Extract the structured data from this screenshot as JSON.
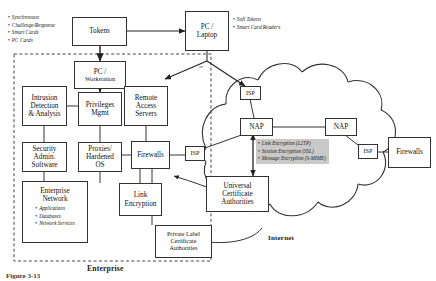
{
  "figure": {
    "caption_bottom": "Enterprise",
    "internet_label": "Internet",
    "or_label": "or",
    "figure_number": "Figure 3-13"
  },
  "annotations": {
    "token_types": [
      "Synchronous",
      "Challenge/Response",
      "Smart Cards",
      "PC Cards"
    ],
    "laptop_types": [
      "Soft Tokens",
      "Smart Card Readers"
    ],
    "encryption_layers": [
      "Link Encryption  (L2TP)",
      "Session Encryption (SSL)",
      "Message Encryption (S-MIME)"
    ]
  },
  "nodes": {
    "tokens": {
      "lines": [
        "Tokens"
      ]
    },
    "pc_laptop": {
      "lines": [
        "PC /",
        "Laptop"
      ]
    },
    "pc_workstation": {
      "lines": [
        "PC /",
        "Workstation"
      ]
    },
    "intrusion": {
      "lines": [
        "Intrusion",
        "Detection",
        "& Analysis"
      ]
    },
    "privileges": {
      "lines": [
        "Privileges",
        "Mgmt"
      ]
    },
    "remote_access": {
      "lines": [
        "Remote",
        "Access",
        "Servers"
      ]
    },
    "security_admin": {
      "lines": [
        "Security",
        "Admin.",
        "Software"
      ]
    },
    "proxies": {
      "lines": [
        "Proxies/",
        "Hardened",
        "OS"
      ]
    },
    "firewalls_center": {
      "lines": [
        "Firewalls"
      ]
    },
    "enterprise_network": {
      "lines": [
        "Enterprise",
        "Network"
      ],
      "items": [
        "Applications",
        "Databases",
        "Network Services"
      ]
    },
    "link_encryption": {
      "lines": [
        "Link",
        "Encryption"
      ]
    },
    "private_label_ca": {
      "lines": [
        "Private Label",
        "Certificate",
        "Authorities"
      ]
    },
    "universal_ca": {
      "lines": [
        "Universal",
        "Certificate",
        "Authorities"
      ]
    },
    "isp_left": {
      "lines": [
        "ISP"
      ]
    },
    "isp_top": {
      "lines": [
        "ISP"
      ]
    },
    "isp_right": {
      "lines": [
        "ISP"
      ]
    },
    "nap_left": {
      "lines": [
        "NAP"
      ]
    },
    "nap_right": {
      "lines": [
        "NAP"
      ]
    },
    "firewalls_right": {
      "lines": [
        "Firewalls"
      ]
    }
  },
  "colors": {
    "stroke": "#333333",
    "background": "#ffffff",
    "encryption_highlight": "#c9c9c9",
    "boundary": "#444444"
  }
}
